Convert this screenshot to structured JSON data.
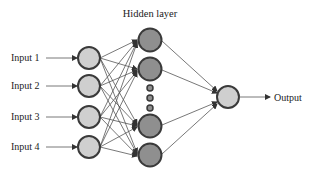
{
  "diagram": {
    "title": "Hidden layer",
    "inputs": [
      {
        "label": "Input 1"
      },
      {
        "label": "Input 2"
      },
      {
        "label": "Input 3"
      },
      {
        "label": "Input 4"
      }
    ],
    "hidden_nodes_visible": 4,
    "ellipsis_dots": 3,
    "output": {
      "label": "Output"
    },
    "colors": {
      "input_fill": "#cfcfcf",
      "hidden_fill": "#8f8f8f",
      "output_fill": "#cfcfcf",
      "stroke": "#3a3a3a",
      "edge": "#555555"
    }
  }
}
